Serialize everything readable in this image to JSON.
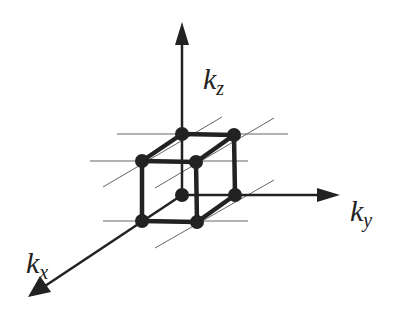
{
  "diagram": {
    "title": "",
    "axes": {
      "kz": {
        "symbol": "k",
        "subscript": "z"
      },
      "ky": {
        "symbol": "k",
        "subscript": "y"
      },
      "kx": {
        "symbol": "k",
        "subscript": "x"
      }
    },
    "colors": {
      "stroke": "#222222",
      "grid": "#666666",
      "background": "#ffffff"
    },
    "cube_vertices": [
      {
        "name": "top-back-left",
        "x": 182,
        "y": 134
      },
      {
        "name": "top-back-right",
        "x": 234,
        "y": 135
      },
      {
        "name": "top-front-left",
        "x": 142,
        "y": 161
      },
      {
        "name": "top-front-right",
        "x": 196,
        "y": 162
      },
      {
        "name": "bottom-back-left",
        "x": 182,
        "y": 195
      },
      {
        "name": "bottom-back-right",
        "x": 235,
        "y": 195
      },
      {
        "name": "bottom-front-left",
        "x": 142,
        "y": 221
      },
      {
        "name": "bottom-front-right",
        "x": 197,
        "y": 222
      }
    ]
  }
}
